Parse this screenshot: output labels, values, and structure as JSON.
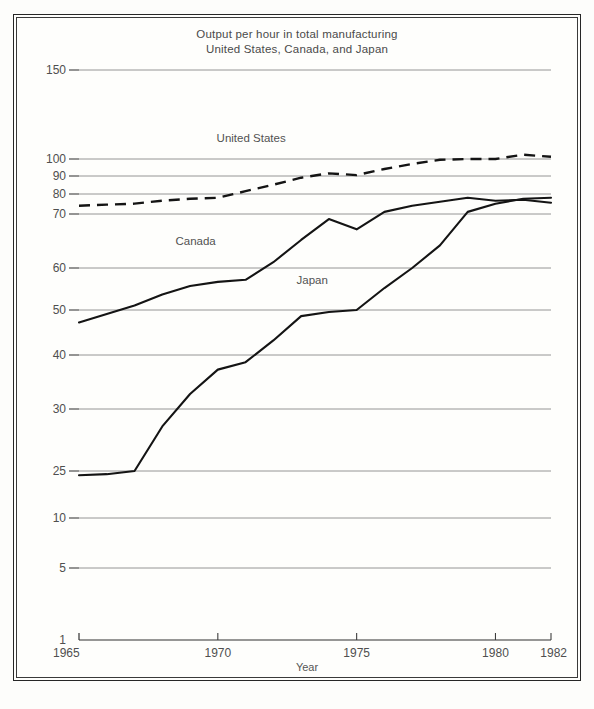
{
  "title": {
    "line1": "Output per hour in total manufacturing",
    "line2": "United States, Canada, and Japan"
  },
  "axis": {
    "xlabel": "Year",
    "ylabel": ""
  },
  "chart_data": {
    "type": "line",
    "title": "Output per hour in total manufacturing United States, Canada, and Japan",
    "xlabel": "Year",
    "ylabel": "",
    "grid": true,
    "legend_position": "inline-annotations",
    "y_scale": "log-like",
    "xlim": [
      1965,
      1982
    ],
    "ylim": [
      1,
      150
    ],
    "x_ticks": [
      1965,
      1970,
      1975,
      1980,
      1982
    ],
    "x_tick_labels": [
      "1965",
      "1970",
      "1975",
      "1980",
      "1982"
    ],
    "y_ticks": [
      150,
      100,
      90,
      80,
      70,
      60,
      50,
      40,
      30,
      25,
      10,
      5,
      1
    ],
    "y_tick_labels": [
      "150",
      "100",
      "90",
      "80",
      "70",
      "60",
      "50",
      "40",
      "30",
      "25",
      "10",
      "5",
      "1"
    ],
    "x": [
      1965,
      1966,
      1967,
      1968,
      1969,
      1970,
      1971,
      1972,
      1973,
      1974,
      1975,
      1976,
      1977,
      1978,
      1979,
      1980,
      1981,
      1982
    ],
    "series": [
      {
        "name": "United States",
        "style": "dashed",
        "values": [
          74,
          74.5,
          75,
          76.5,
          77.5,
          78,
          81.5,
          85,
          89,
          91.5,
          90.5,
          94,
          97,
          99.5,
          100,
          100,
          102,
          101
        ]
      },
      {
        "name": "Canada",
        "style": "solid",
        "values": [
          47,
          49,
          51,
          53.5,
          55.5,
          56.5,
          57,
          61,
          65,
          69,
          67,
          71,
          74,
          76,
          78,
          76.5,
          77,
          75.5
        ]
      },
      {
        "name": "Japan",
        "style": "solid",
        "values": [
          23,
          23.5,
          25,
          28.5,
          32.5,
          37,
          38.5,
          43,
          48.5,
          49.5,
          50,
          55,
          60,
          64,
          71,
          75,
          77.5,
          78
        ]
      }
    ],
    "annotations": [
      {
        "text": "United States",
        "x": 1971.2,
        "y": 108
      },
      {
        "text": "Canada",
        "x": 1969.2,
        "y": 64
      },
      {
        "text": "Japan",
        "x": 1973.4,
        "y": 56
      }
    ]
  }
}
